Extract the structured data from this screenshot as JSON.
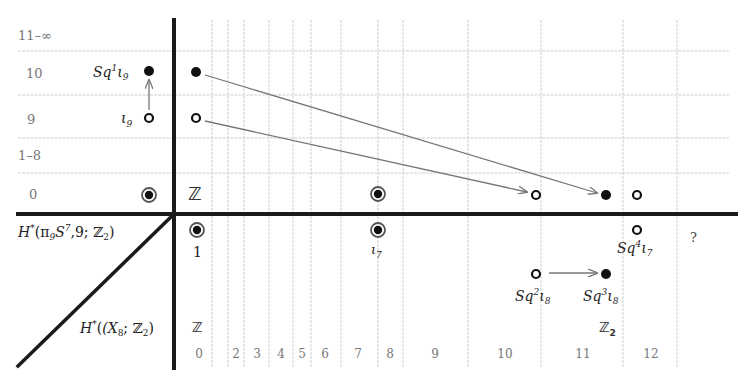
{
  "diagram": {
    "type": "spectral_sequence",
    "top_region_label": "H*(π9 S^7, 9; Z2)",
    "bottom_region_label": "H*(X8; Z2)",
    "row_labels": [
      "0",
      "1–8",
      "9",
      "10",
      "11–∞"
    ],
    "column_labels": [
      "0",
      "2",
      "3",
      "4",
      "5",
      "6",
      "7",
      "8",
      "9",
      "10",
      "11",
      "12"
    ],
    "fiber_classes": [
      {
        "name": "Sq1ι9",
        "label_base": "Sq",
        "sup": "1",
        "sub_var": "ι",
        "sub": "9",
        "row": "10",
        "marker": "filled"
      },
      {
        "name": "ι9",
        "label_base": "ι",
        "sub": "9",
        "row": "9",
        "marker": "open"
      },
      {
        "name": "Z-generator",
        "row": "0",
        "marker": "double"
      }
    ],
    "base_classes": [
      {
        "name": "1",
        "label": "1",
        "col": "0",
        "marker": "double"
      },
      {
        "name": "ι7",
        "label": "ι",
        "sub": "7",
        "col": "7",
        "marker": "double"
      },
      {
        "name": "Sq2ι8",
        "label_base": "Sq",
        "sup": "2",
        "sub": "8",
        "col": "10",
        "marker": "open"
      },
      {
        "name": "Sq3ι8",
        "label_base": "Sq",
        "sup": "3",
        "sub": "8",
        "col": "11",
        "marker": "filled"
      },
      {
        "name": "Sq4ι7",
        "label_base": "Sq",
        "sup": "4",
        "sub": "7",
        "col": "11",
        "marker": "open"
      }
    ],
    "E2_labels": [
      {
        "text": "Z",
        "position": "row 0 col 0"
      },
      {
        "text": "Z",
        "position": "base col 0"
      },
      {
        "text": "Z2",
        "position": "base col 11"
      },
      {
        "text": "?",
        "position": "base col 12"
      }
    ],
    "differentials": [
      {
        "from": "row 10 col 0 (filled)",
        "to": "row 0 col 11 (filled)"
      },
      {
        "from": "row 9 col 0 (open)",
        "to": "row 0 col 10 (open)"
      },
      {
        "from": "ι9",
        "to": "Sq1ι9",
        "kind": "Sq1"
      },
      {
        "from": "Sq2ι8",
        "to": "Sq3ι8",
        "kind": "Sq1"
      }
    ],
    "labels": {
      "sq1i9": "Sq",
      "sq1i9_sup": "1",
      "sq1i9_sub": "9",
      "i9_sub": "9",
      "one": "1",
      "i7_sub": "7",
      "sq2i8_sup": "2",
      "sq2i8_sub": "8",
      "sq3i8_sup": "3",
      "sq3i8_sub": "8",
      "sq4i7_sup": "4",
      "sq4i7_sub": "7",
      "Z": "ℤ",
      "Z2": "ℤ",
      "Z2_sub": "2",
      "question": "?",
      "top_H": "H",
      "top_rest": "(π",
      "top_sub9": "9",
      "top_S": "S",
      "top_sup7": "7",
      "top_tail": ",9; ℤ",
      "top_sub2": "2",
      "bot_H": "H",
      "bot_rest": "(X",
      "bot_sub8": "8",
      "bot_tail": "; ℤ",
      "bot_sub2": "2"
    },
    "colors": {
      "axis": "#1a1a1a",
      "grid": "#c8c8c8",
      "arrow": "#777777",
      "dot": "#111111",
      "text_muted": "#777777"
    }
  }
}
